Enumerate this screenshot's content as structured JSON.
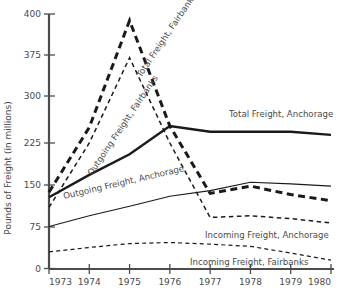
{
  "chart_data": {
    "type": "line",
    "title": "",
    "xlabel": "",
    "ylabel": "Pounds of Freight (in millions)",
    "categories": [
      "1973",
      "1974",
      "1975",
      "1976",
      "1977",
      "1978",
      "1979",
      "1980"
    ],
    "x": [
      1973,
      1974,
      1975,
      1976,
      1977,
      1978,
      1979,
      1980
    ],
    "xlim": [
      1973,
      1980
    ],
    "ylim": [
      0,
      400
    ],
    "ytick_labels": [
      "0",
      "75",
      "150",
      "225",
      "300",
      "375",
      "400"
    ],
    "yticks": [
      0,
      75,
      150,
      225,
      300,
      375,
      400
    ],
    "grid": false,
    "legend_position": "inline-labels",
    "series": [
      {
        "name": "Total Freight, Fairbanks",
        "style": "thick-dashed",
        "values": [
          137,
          250,
          396,
          252,
          135,
          148,
          133,
          122
        ]
      },
      {
        "name": "Outgoing Freight, Fairbanks",
        "style": "thin-dashed",
        "values": [
          110,
          225,
          370,
          225,
          92,
          95,
          90,
          82
        ]
      },
      {
        "name": "Total Freight, Anchorage",
        "style": "thick-solid",
        "values": [
          128,
          168,
          205,
          252,
          243,
          243,
          243,
          238
        ]
      },
      {
        "name": "Outgoing Freight, Anchorage",
        "style": "thin-solid",
        "values": [
          76,
          95,
          112,
          130,
          140,
          155,
          152,
          148
        ]
      },
      {
        "name": "Incoming Freight, Fairbanks",
        "style": "thin-dashed-low",
        "values": [
          30,
          38,
          45,
          47,
          44,
          40,
          28,
          15
        ]
      }
    ],
    "annotations": [
      {
        "text": "Total Freight, Anchorage",
        "x": 229,
        "y": 117,
        "rotate": 0
      },
      {
        "text": "Outgoing Freight, Anchorage",
        "x": 64,
        "y": 199,
        "rotate": -13
      },
      {
        "text": "Incoming Freight, Anchorage",
        "x": 205,
        "y": 238,
        "rotate": 0
      },
      {
        "text": "Incoming Freight, Fairbanks",
        "x": 190,
        "y": 265,
        "rotate": 0
      },
      {
        "text": "Outgoing Freight, Fairbanks",
        "x": 92,
        "y": 176,
        "rotate": -56
      },
      {
        "text": "Total Freight, Fairbanks",
        "x": 141,
        "y": 78,
        "rotate": -56
      }
    ],
    "colors": {
      "axis": "#4c4c4c",
      "series_line": "#1a1a1a",
      "text": "#4a4a4a",
      "background": "#ffffff"
    }
  }
}
